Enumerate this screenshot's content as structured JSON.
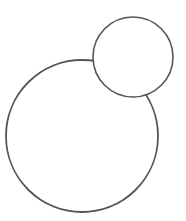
{
  "diagram": {
    "stroke_color": "#555555",
    "background": "#ffffff",
    "shapes": [
      {
        "name": "large-circle",
        "cx": 82,
        "cy": 136,
        "r": 76
      },
      {
        "name": "small-circle",
        "cx": 133,
        "cy": 57,
        "r": 40
      }
    ]
  }
}
